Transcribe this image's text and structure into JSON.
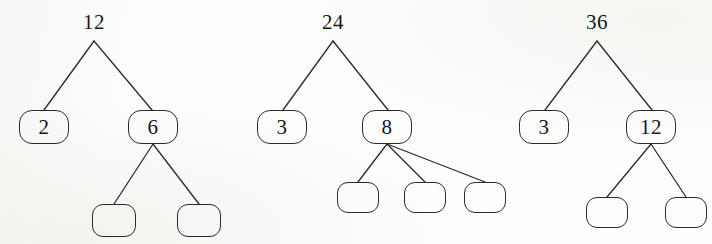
{
  "figure": {
    "ink_color": "#2b2b2b",
    "background_color": "#fdfdfc"
  },
  "trees": [
    {
      "name": "factor-tree-12",
      "root": {
        "label": "12",
        "x": 94,
        "y": 12
      },
      "nodes": [
        {
          "label": "2",
          "x": 19,
          "y": 110,
          "w": 50,
          "h": 34,
          "empty": false
        },
        {
          "label": "6",
          "x": 128,
          "y": 110,
          "w": 50,
          "h": 34,
          "empty": false
        },
        {
          "label": "",
          "x": 92,
          "y": 204,
          "w": 44,
          "h": 33,
          "empty": true
        },
        {
          "label": "",
          "x": 177,
          "y": 204,
          "w": 44,
          "h": 33,
          "empty": true
        }
      ],
      "edges": [
        {
          "x1": 94,
          "y1": 41,
          "x2": 44,
          "y2": 110
        },
        {
          "x1": 94,
          "y1": 41,
          "x2": 152,
          "y2": 110
        },
        {
          "x1": 153,
          "y1": 144,
          "x2": 114,
          "y2": 204
        },
        {
          "x1": 153,
          "y1": 144,
          "x2": 199,
          "y2": 204
        }
      ]
    },
    {
      "name": "factor-tree-24",
      "root": {
        "label": "24",
        "x": 333,
        "y": 12
      },
      "nodes": [
        {
          "label": "3",
          "x": 257,
          "y": 110,
          "w": 50,
          "h": 34,
          "empty": false
        },
        {
          "label": "8",
          "x": 362,
          "y": 110,
          "w": 50,
          "h": 34,
          "empty": false
        },
        {
          "label": "",
          "x": 337,
          "y": 182,
          "w": 42,
          "h": 31,
          "empty": true
        },
        {
          "label": "",
          "x": 404,
          "y": 182,
          "w": 42,
          "h": 31,
          "empty": true
        },
        {
          "label": "",
          "x": 464,
          "y": 182,
          "w": 42,
          "h": 31,
          "empty": true
        }
      ],
      "edges": [
        {
          "x1": 333,
          "y1": 41,
          "x2": 283,
          "y2": 110
        },
        {
          "x1": 333,
          "y1": 41,
          "x2": 388,
          "y2": 110
        },
        {
          "x1": 387,
          "y1": 144,
          "x2": 358,
          "y2": 182
        },
        {
          "x1": 387,
          "y1": 144,
          "x2": 425,
          "y2": 182
        },
        {
          "x1": 387,
          "y1": 144,
          "x2": 485,
          "y2": 182
        }
      ]
    },
    {
      "name": "factor-tree-36",
      "root": {
        "label": "36",
        "x": 597,
        "y": 12
      },
      "nodes": [
        {
          "label": "3",
          "x": 519,
          "y": 110,
          "w": 50,
          "h": 34,
          "empty": false
        },
        {
          "label": "12",
          "x": 626,
          "y": 110,
          "w": 50,
          "h": 34,
          "empty": false
        },
        {
          "label": "",
          "x": 586,
          "y": 197,
          "w": 42,
          "h": 31,
          "empty": true
        },
        {
          "label": "",
          "x": 665,
          "y": 197,
          "w": 42,
          "h": 31,
          "empty": true
        }
      ],
      "edges": [
        {
          "x1": 597,
          "y1": 41,
          "x2": 545,
          "y2": 110
        },
        {
          "x1": 597,
          "y1": 41,
          "x2": 652,
          "y2": 110
        },
        {
          "x1": 651,
          "y1": 144,
          "x2": 607,
          "y2": 197
        },
        {
          "x1": 651,
          "y1": 144,
          "x2": 686,
          "y2": 197
        }
      ]
    }
  ]
}
